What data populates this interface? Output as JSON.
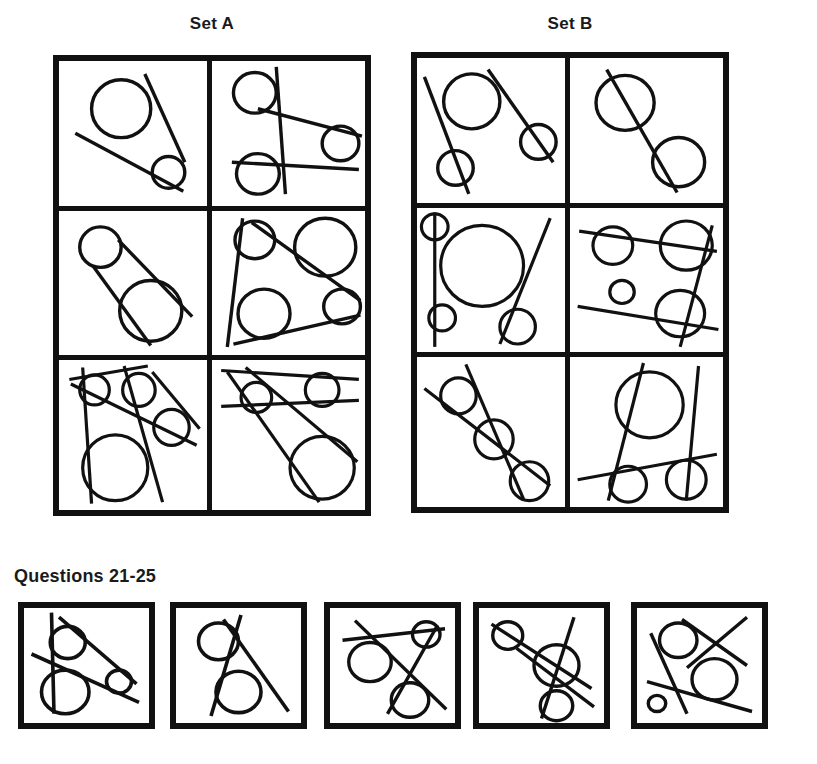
{
  "page": {
    "background_color": "#ffffff",
    "ink_color": "#111111"
  },
  "sets": [
    {
      "id": "set-a",
      "label": "Set A",
      "cells": [
        {
          "id": "a1",
          "position": "row1-left"
        },
        {
          "id": "a2",
          "position": "row1-right"
        },
        {
          "id": "a3",
          "position": "row2-left"
        },
        {
          "id": "a4",
          "position": "row2-right"
        },
        {
          "id": "a5",
          "position": "row3-left"
        },
        {
          "id": "a6",
          "position": "row3-right"
        }
      ]
    },
    {
      "id": "set-b",
      "label": "Set B",
      "cells": [
        {
          "id": "b1",
          "position": "row1-left"
        },
        {
          "id": "b2",
          "position": "row1-right"
        },
        {
          "id": "b3",
          "position": "row2-left"
        },
        {
          "id": "b4",
          "position": "row2-right"
        },
        {
          "id": "b5",
          "position": "row3-left"
        },
        {
          "id": "b6",
          "position": "row3-right"
        }
      ]
    }
  ],
  "questions": {
    "heading": "Questions 21-25",
    "items": [
      {
        "id": "q21",
        "number": "21"
      },
      {
        "id": "q22",
        "number": "22"
      },
      {
        "id": "q23",
        "number": "23"
      },
      {
        "id": "q24",
        "number": "24"
      },
      {
        "id": "q25",
        "number": "25"
      }
    ]
  },
  "figures": {
    "a1": {
      "viewBox": "0 0 100 100",
      "stroke_width": 3.4,
      "circles": [
        {
          "cx": 42,
          "cy": 33,
          "r": 20
        },
        {
          "cx": 74,
          "cy": 77,
          "r": 11
        }
      ],
      "lines": [
        {
          "x1": 11,
          "y1": 50,
          "x2": 84,
          "y2": 90
        },
        {
          "x1": 58,
          "y1": 9,
          "x2": 85,
          "y2": 70
        }
      ]
    },
    "a2": {
      "viewBox": "0 0 100 100",
      "stroke_width": 3.4,
      "circles": [
        {
          "cx": 28,
          "cy": 22,
          "r": 14
        },
        {
          "cx": 30,
          "cy": 78,
          "r": 14
        },
        {
          "cx": 84,
          "cy": 57,
          "r": 12
        }
      ],
      "lines": [
        {
          "x1": 42,
          "y1": 4,
          "x2": 48,
          "y2": 92
        },
        {
          "x1": 13,
          "y1": 70,
          "x2": 96,
          "y2": 75
        },
        {
          "x1": 30,
          "y1": 33,
          "x2": 98,
          "y2": 52
        }
      ]
    },
    "a3": {
      "viewBox": "0 0 100 100",
      "stroke_width": 3.4,
      "circles": [
        {
          "cx": 28,
          "cy": 25,
          "r": 14
        },
        {
          "cx": 62,
          "cy": 69,
          "r": 21
        }
      ],
      "lines": [
        {
          "x1": 23,
          "y1": 38,
          "x2": 62,
          "y2": 93
        },
        {
          "x1": 40,
          "y1": 20,
          "x2": 90,
          "y2": 73
        }
      ]
    },
    "a4": {
      "viewBox": "0 0 100 100",
      "stroke_width": 3.4,
      "circles": [
        {
          "cx": 28,
          "cy": 20,
          "r": 13
        },
        {
          "cx": 74,
          "cy": 25,
          "r": 20
        },
        {
          "cx": 34,
          "cy": 71,
          "r": 17
        },
        {
          "cx": 85,
          "cy": 66,
          "r": 12
        }
      ],
      "lines": [
        {
          "x1": 20,
          "y1": 5,
          "x2": 10,
          "y2": 94
        },
        {
          "x1": 26,
          "y1": 8,
          "x2": 97,
          "y2": 62
        },
        {
          "x1": 14,
          "y1": 92,
          "x2": 97,
          "y2": 72
        }
      ]
    },
    "a5": {
      "viewBox": "0 0 100 100",
      "stroke_width": 3.2,
      "circles": [
        {
          "cx": 24,
          "cy": 20,
          "r": 10
        },
        {
          "cx": 54,
          "cy": 20,
          "r": 11
        },
        {
          "cx": 76,
          "cy": 45,
          "r": 12
        },
        {
          "cx": 38,
          "cy": 72,
          "r": 22
        }
      ],
      "lines": [
        {
          "x1": 7,
          "y1": 13,
          "x2": 60,
          "y2": 4
        },
        {
          "x1": 16,
          "y1": 5,
          "x2": 22,
          "y2": 96
        },
        {
          "x1": 8,
          "y1": 16,
          "x2": 93,
          "y2": 57
        },
        {
          "x1": 44,
          "y1": 4,
          "x2": 70,
          "y2": 95
        },
        {
          "x1": 63,
          "y1": 8,
          "x2": 95,
          "y2": 46
        }
      ]
    },
    "a6": {
      "viewBox": "0 0 100 100",
      "stroke_width": 3.2,
      "circles": [
        {
          "cx": 29,
          "cy": 25,
          "r": 10
        },
        {
          "cx": 72,
          "cy": 20,
          "r": 11
        },
        {
          "cx": 72,
          "cy": 72,
          "r": 21
        }
      ],
      "lines": [
        {
          "x1": 6,
          "y1": 7,
          "x2": 96,
          "y2": 13
        },
        {
          "x1": 6,
          "y1": 31,
          "x2": 96,
          "y2": 27
        },
        {
          "x1": 10,
          "y1": 8,
          "x2": 70,
          "y2": 95
        },
        {
          "x1": 22,
          "y1": 5,
          "x2": 95,
          "y2": 68
        }
      ]
    },
    "b1": {
      "viewBox": "0 0 100 100",
      "stroke_width": 3.4,
      "circles": [
        {
          "cx": 37,
          "cy": 30,
          "r": 19
        },
        {
          "cx": 26,
          "cy": 76,
          "r": 12
        },
        {
          "cx": 82,
          "cy": 58,
          "r": 12
        }
      ],
      "lines": [
        {
          "x1": 5,
          "y1": 13,
          "x2": 35,
          "y2": 94
        },
        {
          "x1": 48,
          "y1": 8,
          "x2": 92,
          "y2": 72
        }
      ]
    },
    "b2": {
      "viewBox": "0 0 100 100",
      "stroke_width": 3.4,
      "circles": [
        {
          "cx": 36,
          "cy": 31,
          "r": 19
        },
        {
          "cx": 71,
          "cy": 72,
          "r": 17
        }
      ],
      "lines": [
        {
          "x1": 24,
          "y1": 8,
          "x2": 70,
          "y2": 93
        }
      ]
    },
    "b3": {
      "viewBox": "0 0 100 100",
      "stroke_width": 3.2,
      "circles": [
        {
          "cx": 12,
          "cy": 13,
          "r": 9
        },
        {
          "cx": 44,
          "cy": 40,
          "r": 28
        },
        {
          "cx": 17,
          "cy": 76,
          "r": 9
        },
        {
          "cx": 68,
          "cy": 82,
          "r": 12
        }
      ],
      "lines": [
        {
          "x1": 12,
          "y1": 3,
          "x2": 12,
          "y2": 96
        },
        {
          "x1": 90,
          "y1": 7,
          "x2": 56,
          "y2": 94
        }
      ]
    },
    "b4": {
      "viewBox": "0 0 100 100",
      "stroke_width": 3.2,
      "circles": [
        {
          "cx": 28,
          "cy": 26,
          "r": 13
        },
        {
          "cx": 76,
          "cy": 26,
          "r": 17
        },
        {
          "cx": 34,
          "cy": 58,
          "r": 8
        },
        {
          "cx": 72,
          "cy": 73,
          "r": 16
        }
      ],
      "lines": [
        {
          "x1": 6,
          "y1": 16,
          "x2": 96,
          "y2": 30
        },
        {
          "x1": 5,
          "y1": 68,
          "x2": 97,
          "y2": 84
        },
        {
          "x1": 93,
          "y1": 12,
          "x2": 72,
          "y2": 96
        }
      ]
    },
    "b5": {
      "viewBox": "0 0 100 100",
      "stroke_width": 3.2,
      "circles": [
        {
          "cx": 28,
          "cy": 26,
          "r": 12
        },
        {
          "cx": 52,
          "cy": 55,
          "r": 13
        },
        {
          "cx": 76,
          "cy": 83,
          "r": 13
        }
      ],
      "lines": [
        {
          "x1": 33,
          "y1": 5,
          "x2": 72,
          "y2": 95
        },
        {
          "x1": 5,
          "y1": 21,
          "x2": 90,
          "y2": 86
        }
      ]
    },
    "b6": {
      "viewBox": "0 0 100 100",
      "stroke_width": 3.2,
      "circles": [
        {
          "cx": 52,
          "cy": 32,
          "r": 22
        },
        {
          "cx": 38,
          "cy": 85,
          "r": 12
        },
        {
          "cx": 76,
          "cy": 82,
          "r": 13
        }
      ],
      "lines": [
        {
          "x1": 48,
          "y1": 4,
          "x2": 25,
          "y2": 96
        },
        {
          "x1": 84,
          "y1": 6,
          "x2": 76,
          "y2": 96
        },
        {
          "x1": 5,
          "y1": 82,
          "x2": 96,
          "y2": 65
        }
      ]
    },
    "q21": {
      "viewBox": "0 0 100 100",
      "stroke_width": 3.6,
      "circles": [
        {
          "cx": 35,
          "cy": 30,
          "r": 14
        },
        {
          "cx": 33,
          "cy": 73,
          "r": 19
        },
        {
          "cx": 76,
          "cy": 64,
          "r": 10
        }
      ],
      "lines": [
        {
          "x1": 22,
          "y1": 4,
          "x2": 24,
          "y2": 92
        },
        {
          "x1": 6,
          "y1": 40,
          "x2": 92,
          "y2": 82
        },
        {
          "x1": 28,
          "y1": 8,
          "x2": 90,
          "y2": 66
        }
      ]
    },
    "q22": {
      "viewBox": "0 0 100 100",
      "stroke_width": 3.6,
      "circles": [
        {
          "cx": 34,
          "cy": 29,
          "r": 16
        },
        {
          "cx": 50,
          "cy": 73,
          "r": 18
        }
      ],
      "lines": [
        {
          "x1": 52,
          "y1": 6,
          "x2": 28,
          "y2": 94
        },
        {
          "x1": 38,
          "y1": 10,
          "x2": 90,
          "y2": 90
        }
      ]
    },
    "q23": {
      "viewBox": "0 0 100 100",
      "stroke_width": 3.4,
      "circles": [
        {
          "cx": 32,
          "cy": 47,
          "r": 17
        },
        {
          "cx": 77,
          "cy": 23,
          "r": 11
        },
        {
          "cx": 64,
          "cy": 80,
          "r": 15
        }
      ],
      "lines": [
        {
          "x1": 10,
          "y1": 28,
          "x2": 92,
          "y2": 18
        },
        {
          "x1": 20,
          "y1": 11,
          "x2": 93,
          "y2": 88
        },
        {
          "x1": 46,
          "y1": 92,
          "x2": 86,
          "y2": 15
        }
      ]
    },
    "q24": {
      "viewBox": "0 0 100 100",
      "stroke_width": 3.4,
      "circles": [
        {
          "cx": 23,
          "cy": 24,
          "r": 12
        },
        {
          "cx": 62,
          "cy": 50,
          "r": 18
        },
        {
          "cx": 62,
          "cy": 85,
          "r": 13
        }
      ],
      "lines": [
        {
          "x1": 10,
          "y1": 14,
          "x2": 90,
          "y2": 70
        },
        {
          "x1": 30,
          "y1": 35,
          "x2": 92,
          "y2": 86
        },
        {
          "x1": 76,
          "y1": 8,
          "x2": 50,
          "y2": 96
        }
      ]
    },
    "q25": {
      "viewBox": "0 0 100 100",
      "stroke_width": 3.4,
      "circles": [
        {
          "cx": 33,
          "cy": 28,
          "r": 15
        },
        {
          "cx": 62,
          "cy": 62,
          "r": 18
        },
        {
          "cx": 16,
          "cy": 83,
          "r": 7
        }
      ],
      "lines": [
        {
          "x1": 36,
          "y1": 10,
          "x2": 88,
          "y2": 50
        },
        {
          "x1": 88,
          "y1": 8,
          "x2": 40,
          "y2": 52
        },
        {
          "x1": 11,
          "y1": 22,
          "x2": 40,
          "y2": 92
        },
        {
          "x1": 8,
          "y1": 64,
          "x2": 92,
          "y2": 90
        }
      ]
    }
  }
}
